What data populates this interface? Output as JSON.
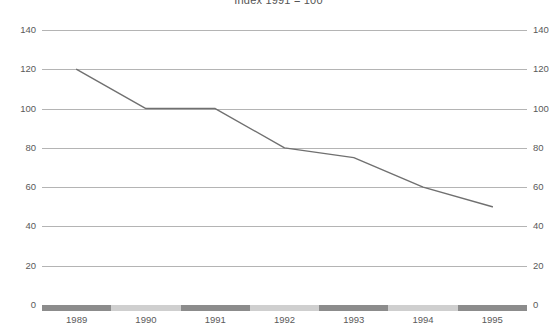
{
  "chart_data": {
    "type": "line",
    "title": "Index 1991 = 100",
    "xlabel": "",
    "ylabel": "",
    "x": [
      "1989",
      "1990",
      "1991",
      "1992",
      "1993",
      "1994",
      "1995"
    ],
    "categories": [
      "1989",
      "1990",
      "1991",
      "1992",
      "1993",
      "1994",
      "1995"
    ],
    "values": [
      120,
      100,
      100,
      80,
      75,
      60,
      50
    ],
    "series": [
      {
        "name": "Index",
        "values": [
          120,
          100,
          100,
          80,
          75,
          60,
          50
        ],
        "color": "#707070"
      }
    ],
    "ylim": [
      0,
      140
    ],
    "yticks": [
      0,
      20,
      40,
      60,
      80,
      100,
      120,
      140
    ],
    "ytick_labels_left": [
      "0",
      "20",
      "40",
      "60",
      "80",
      "100",
      "120",
      "140"
    ],
    "ytick_labels_right": [
      "0",
      "20",
      "40",
      "60",
      "80",
      "100",
      "120",
      "140"
    ],
    "right_axis_clipped": true,
    "grid": true,
    "legend": "none",
    "axis_band_colors": {
      "dark": "#8c8c8c",
      "light": "#cfcfcf"
    },
    "axis_bands": [
      {
        "label": "1989",
        "shade": "dark"
      },
      {
        "label": "1990",
        "shade": "light"
      },
      {
        "label": "1991",
        "shade": "dark"
      },
      {
        "label": "1992",
        "shade": "light"
      },
      {
        "label": "1993",
        "shade": "dark"
      },
      {
        "label": "1994",
        "shade": "light"
      },
      {
        "label": "1995",
        "shade": "dark"
      }
    ],
    "gridline_color": "#b4b4b4",
    "line_color": "#707070"
  }
}
